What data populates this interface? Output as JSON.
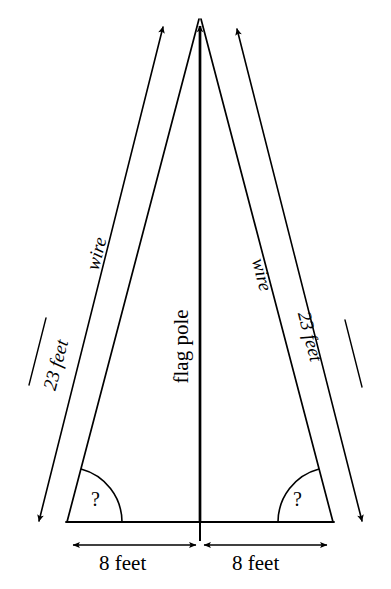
{
  "figure": {
    "type": "geometry-diagram",
    "background_color": "#ffffff",
    "stroke_color": "#000000"
  },
  "labels": {
    "pole": "flag pole",
    "wire_left": "wire",
    "wire_right": "wire",
    "hyp_left": "23 feet",
    "hyp_right": "23 feet",
    "base_left": "8 feet",
    "base_right": "8 feet",
    "angle_left": "?",
    "angle_right": "?"
  },
  "measurements": {
    "wire_length_value": 23,
    "wire_length_unit": "feet",
    "half_base_value": 8,
    "half_base_unit": "feet",
    "unknown_angle_symbol": "?"
  },
  "geometry": {
    "apex": [
      200,
      18
    ],
    "base_left_vertex": [
      67,
      522
    ],
    "base_right_vertex": [
      333,
      522
    ],
    "base_midpoint": [
      200,
      522
    ],
    "pole_top": [
      200,
      18
    ],
    "outer_arrow_left": {
      "from": [
        36,
        527
      ],
      "to": [
        165,
        20
      ]
    },
    "outer_arrow_right": {
      "from": [
        235,
        22
      ],
      "to": [
        365,
        527
      ]
    },
    "dimension_line_y": 545
  }
}
